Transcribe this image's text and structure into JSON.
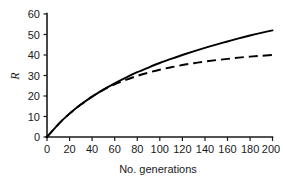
{
  "chart_data": {
    "type": "line",
    "title": "",
    "subtitle": "",
    "xlabel": "No. generations",
    "ylabel": "R",
    "xlim": [
      0,
      200
    ],
    "ylim": [
      0,
      60
    ],
    "grid": false,
    "legend": null,
    "x_ticks": [
      0,
      20,
      40,
      60,
      80,
      100,
      120,
      140,
      160,
      180,
      200
    ],
    "y_ticks": [
      0,
      10,
      20,
      30,
      40,
      50,
      60
    ],
    "x_tick_labels": [
      "0",
      "20",
      "40",
      "60",
      "80",
      "100",
      "120",
      "140",
      "160",
      "180",
      "200"
    ],
    "y_tick_labels": [
      "0",
      "10",
      "20",
      "30",
      "40",
      "50",
      "60"
    ],
    "x": [
      0,
      10,
      20,
      30,
      40,
      50,
      60,
      70,
      80,
      90,
      100,
      110,
      120,
      130,
      140,
      150,
      160,
      170,
      180,
      190,
      200
    ],
    "series": [
      {
        "name": "solid-curve",
        "style": "solid",
        "color": "#000000",
        "values": [
          0,
          6.2,
          11.4,
          15.8,
          19.7,
          23.1,
          26.2,
          29.0,
          31.6,
          33.9,
          36.1,
          38.1,
          40.0,
          41.8,
          43.5,
          45.1,
          46.6,
          48.1,
          49.5,
          50.8,
          52.0
        ]
      },
      {
        "name": "dashed-curve",
        "style": "dashed",
        "color": "#000000",
        "values": [
          0,
          6.2,
          11.4,
          15.8,
          19.7,
          23.0,
          25.7,
          27.9,
          29.8,
          31.4,
          32.8,
          34.0,
          35.1,
          36.0,
          36.8,
          37.5,
          38.1,
          38.7,
          39.2,
          39.6,
          40.0
        ]
      }
    ],
    "annotations": []
  },
  "axes": {
    "y_axis_title": "R",
    "x_axis_title": "No. generations"
  }
}
